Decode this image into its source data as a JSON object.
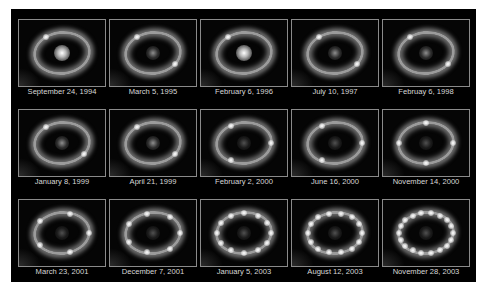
{
  "figure": {
    "background_color": "#000000",
    "label_color": "#d8d8d8",
    "rows": [
      {
        "panels": [
          {
            "date": "September 24, 1994",
            "core": "bright",
            "ring_spots": 1
          },
          {
            "date": "March  5, 1995",
            "core": "medium",
            "ring_spots": 2
          },
          {
            "date": "February 6, 1996",
            "core": "bright",
            "ring_spots": 1
          },
          {
            "date": "July 10, 1997",
            "core": "medium",
            "ring_spots": 2
          },
          {
            "date": "Februay 6, 1998",
            "core": "medium",
            "ring_spots": 2
          }
        ]
      },
      {
        "panels": [
          {
            "date": "January 8, 1999",
            "core": "medium",
            "ring_spots": 2
          },
          {
            "date": "April 21, 1999",
            "core": "medium",
            "ring_spots": 2
          },
          {
            "date": "February 2, 2000",
            "core": "faint",
            "ring_spots": 3
          },
          {
            "date": "June 16, 2000",
            "core": "faint",
            "ring_spots": 3
          },
          {
            "date": "November 14, 2000",
            "core": "faint",
            "ring_spots": 4
          }
        ]
      },
      {
        "panels": [
          {
            "date": "March 23, 2001",
            "core": "faint",
            "ring_spots": 5
          },
          {
            "date": "December 7, 2001",
            "core": "faint",
            "ring_spots": 7
          },
          {
            "date": "January 5, 2003",
            "core": "faint",
            "ring_spots": 12
          },
          {
            "date": "August 12, 2003",
            "core": "faint",
            "ring_spots": 14
          },
          {
            "date": "November 28, 2003",
            "core": "faint",
            "ring_spots": 18
          }
        ]
      }
    ]
  }
}
